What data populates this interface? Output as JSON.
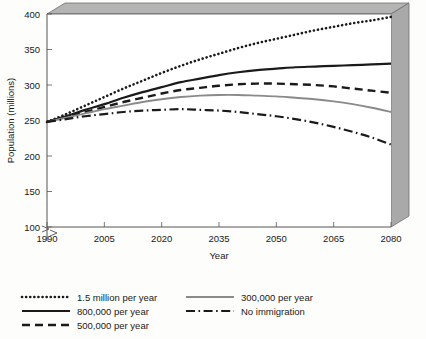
{
  "chart_data": {
    "type": "line",
    "title": "",
    "xlabel": "Year",
    "ylabel": "Population (millions)",
    "xlim": [
      1990,
      2080
    ],
    "ylim": [
      100,
      400
    ],
    "yaxis_break_below": 100,
    "grid": false,
    "legend_position": "below",
    "xticks": [
      1990,
      2005,
      2020,
      2035,
      2050,
      2065,
      2080
    ],
    "xtick_labels": [
      "1990",
      "2005",
      "2020",
      "2035",
      "2050",
      "2065",
      "2080"
    ],
    "yticks": [
      100,
      150,
      200,
      250,
      300,
      350,
      400
    ],
    "ytick_labels": [
      "100",
      "150",
      "200",
      "250",
      "300",
      "350",
      "400"
    ],
    "x": [
      1990,
      1995,
      2000,
      2005,
      2010,
      2015,
      2020,
      2025,
      2030,
      2035,
      2040,
      2045,
      2050,
      2055,
      2060,
      2065,
      2070,
      2075,
      2080
    ],
    "series": [
      {
        "name": "1.5 million per year",
        "label": "1.5 million per year",
        "style": "dotted",
        "color": "#1a1a1a",
        "values": [
          248,
          259,
          271,
          283,
          295,
          306,
          317,
          327,
          336,
          344,
          352,
          359,
          365,
          371,
          377,
          382,
          387,
          391,
          396
        ]
      },
      {
        "name": "800,000 per year",
        "label": "800,000 per year",
        "style": "solid",
        "color": "#1a1a1a",
        "values": [
          248,
          256,
          265,
          273,
          282,
          290,
          297,
          304,
          309,
          314,
          318,
          321,
          323,
          325,
          326,
          327,
          328,
          329,
          330
        ]
      },
      {
        "name": "500,000 per year",
        "label": "500,000 per year",
        "style": "dashed",
        "color": "#1a1a1a",
        "values": [
          248,
          255,
          262,
          269,
          276,
          282,
          288,
          293,
          296,
          299,
          301,
          302,
          302,
          301,
          300,
          298,
          295,
          292,
          289
        ]
      },
      {
        "name": "300,000 per year",
        "label": "300,000 per year",
        "style": "solid-gray",
        "color": "#8a8a8a",
        "values": [
          248,
          254,
          260,
          266,
          271,
          276,
          280,
          283,
          285,
          286,
          286,
          285,
          284,
          282,
          280,
          277,
          273,
          268,
          262
        ]
      },
      {
        "name": "No immigration",
        "label": "No immigration",
        "style": "dashdot",
        "color": "#1a1a1a",
        "values": [
          248,
          252,
          256,
          259,
          262,
          264,
          265,
          266,
          265,
          264,
          262,
          259,
          256,
          252,
          247,
          241,
          234,
          226,
          216
        ]
      }
    ]
  },
  "legend": {
    "items": [
      {
        "label": "1.5 million per year",
        "style": "dotted",
        "color": "#1a1a1a"
      },
      {
        "label": "300,000 per year",
        "style": "solid-gray",
        "color": "#8a8a8a"
      },
      {
        "label": "800,000 per year",
        "style": "solid",
        "color": "#1a1a1a"
      },
      {
        "label": "No immigration",
        "style": "dashdot",
        "color": "#1a1a1a"
      },
      {
        "label": "500,000 per year",
        "style": "dashed",
        "color": "#1a1a1a"
      }
    ]
  },
  "frame": {
    "top_band_color": "#b4b4b4",
    "right_wall_color": "#a9a9a9",
    "axis_color": "#555555"
  }
}
